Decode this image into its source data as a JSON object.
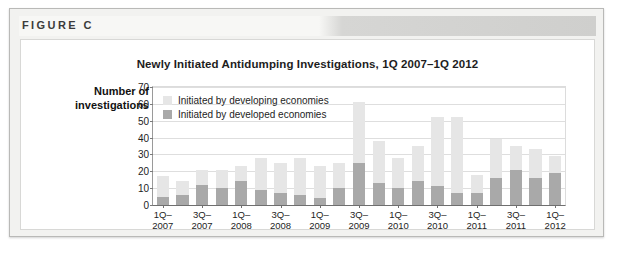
{
  "figure": {
    "label": "FIGURE C"
  },
  "chart_data": {
    "type": "bar",
    "subtype": "stacked-bar",
    "title": "Newly Initiated Antidumping Investigations, 1Q 2007–1Q 2012",
    "xlabel": "",
    "ylabel": "Number of investigations",
    "ylim": [
      0,
      70
    ],
    "yticks": [
      0,
      10,
      20,
      30,
      40,
      50,
      60,
      70
    ],
    "grid": true,
    "legend_position": "inside-top-left",
    "categories": [
      "1Q-2007",
      "2Q-2007",
      "3Q-2007",
      "4Q-2007",
      "1Q-2008",
      "2Q-2008",
      "3Q-2008",
      "4Q-2008",
      "1Q-2009",
      "2Q-2009",
      "3Q-2009",
      "4Q-2009",
      "1Q-2010",
      "2Q-2010",
      "3Q-2010",
      "4Q-2010",
      "1Q-2011",
      "2Q-2011",
      "3Q-2011",
      "4Q-2011",
      "1Q-2012"
    ],
    "tick_labels": [
      {
        "index": 0,
        "line1": "1Q–",
        "line2": "2007"
      },
      {
        "index": 2,
        "line1": "3Q–",
        "line2": "2007"
      },
      {
        "index": 4,
        "line1": "1Q–",
        "line2": "2008"
      },
      {
        "index": 6,
        "line1": "3Q–",
        "line2": "2008"
      },
      {
        "index": 8,
        "line1": "1Q–",
        "line2": "2009"
      },
      {
        "index": 10,
        "line1": "3Q–",
        "line2": "2009"
      },
      {
        "index": 12,
        "line1": "1Q–",
        "line2": "2010"
      },
      {
        "index": 14,
        "line1": "3Q–",
        "line2": "2010"
      },
      {
        "index": 16,
        "line1": "1Q–",
        "line2": "2011"
      },
      {
        "index": 18,
        "line1": "3Q–",
        "line2": "2011"
      },
      {
        "index": 20,
        "line1": "1Q–",
        "line2": "2012"
      }
    ],
    "series": [
      {
        "name": "Initiated by developed economies",
        "color": "#a9a9a9",
        "values": [
          5,
          6,
          12,
          10,
          14,
          9,
          7,
          6,
          4,
          10,
          25,
          13,
          10,
          14,
          11,
          7,
          7,
          16,
          21,
          16,
          19
        ]
      },
      {
        "name": "Initiated by developing economies",
        "color": "#e6e6e6",
        "values": [
          12,
          8,
          9,
          11,
          9,
          19,
          18,
          22,
          19,
          15,
          36,
          25,
          18,
          21,
          41,
          45,
          11,
          23,
          14,
          17,
          10
        ]
      }
    ],
    "totals": [
      17,
      14,
      21,
      21,
      23,
      28,
      25,
      28,
      23,
      25,
      61,
      38,
      28,
      35,
      52,
      52,
      18,
      39,
      35,
      33,
      29
    ]
  }
}
